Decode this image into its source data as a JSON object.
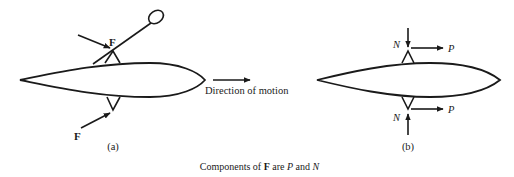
{
  "figure": {
    "caption": {
      "prefix": "Components of ",
      "force_symbol": "F",
      "middle": " are ",
      "component_p": "P",
      "conjunction": " and ",
      "component_n": "N"
    },
    "panel_a": {
      "label": "(a)",
      "upper_force_label": "F",
      "lower_force_label": "F",
      "direction_label": "Direction of motion"
    },
    "panel_b": {
      "label": "(b)",
      "upper_normal_label": "N",
      "upper_parallel_label": "P",
      "lower_normal_label": "N",
      "lower_parallel_label": "P"
    },
    "colors": {
      "stroke": "#1a1a1a",
      "background": "#ffffff"
    }
  }
}
